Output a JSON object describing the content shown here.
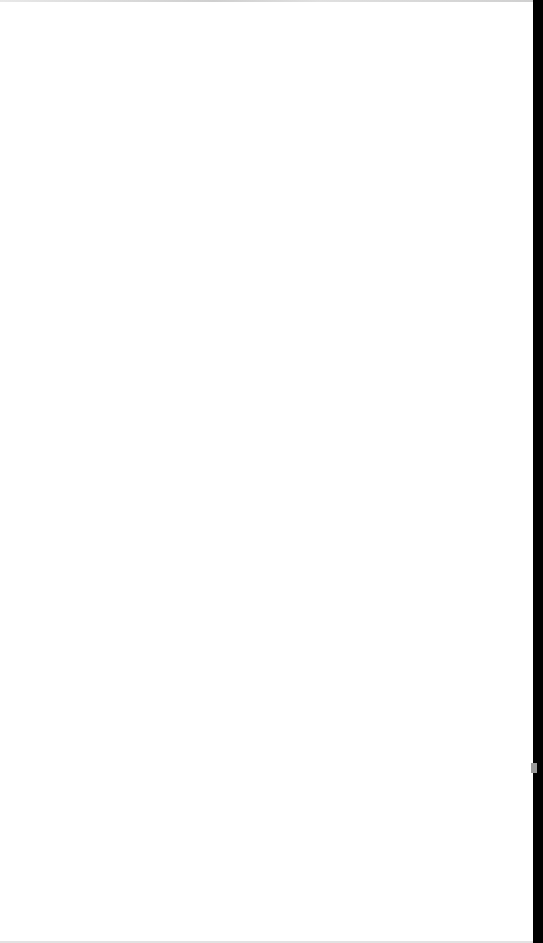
{
  "page": {
    "state": "blank",
    "background_color": "#ffffff",
    "edge_bar_color": "#000000"
  }
}
